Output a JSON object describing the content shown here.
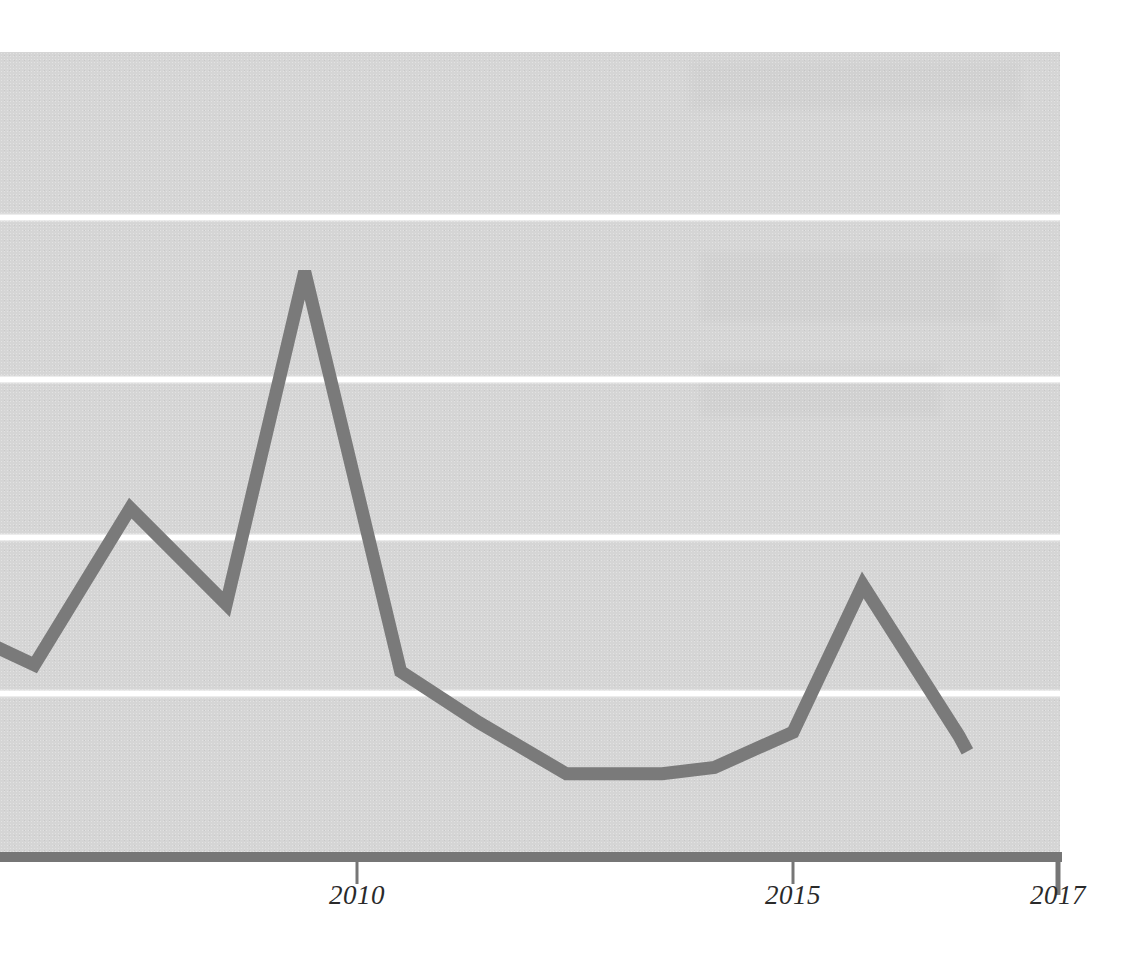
{
  "chart_data": {
    "type": "line",
    "title": "",
    "subtitle": "",
    "xlabel": "",
    "ylabel": "",
    "grid": true,
    "legend": false,
    "legend_position": "none",
    "xlim": [
      2005.6,
      2017.0
    ],
    "ylim": [
      0,
      5
    ],
    "y_gridline_values": [
      1,
      2,
      3,
      4
    ],
    "x_tick_labels": [
      "2010",
      "2015",
      "2017"
    ],
    "x_tick_values": [
      2010,
      2015,
      2017
    ],
    "y_tick_labels": [],
    "x": [
      2005.6,
      2006.3,
      2007.4,
      2008.5,
      2009.4,
      2010.5,
      2011.4,
      2012.4,
      2013.5,
      2014.1,
      2015.0,
      2015.8,
      2016.9,
      2017.0
    ],
    "series": [
      {
        "name": "series-1",
        "color": "#7a7a7a",
        "values": [
          0.345,
          0.3,
          0.545,
          0.395,
          0.915,
          0.29,
          0.21,
          0.13,
          0.13,
          0.14,
          0.195,
          0.425,
          0.19,
          0.165
        ]
      }
    ],
    "annotations": []
  },
  "axes": {
    "x_ticks": [
      {
        "label": "2010",
        "x_px": 357
      },
      {
        "label": "2015",
        "x_px": 793
      },
      {
        "label": "2017",
        "x_px": 1058
      }
    ]
  },
  "style": {
    "panel_color": "#d5d5d5",
    "gridline_color": "#ffffff",
    "series_color": "#7a7a7a",
    "axis_color": "#767676",
    "tick_label_color": "#2a2a2a",
    "page_background": "#ffffff"
  }
}
